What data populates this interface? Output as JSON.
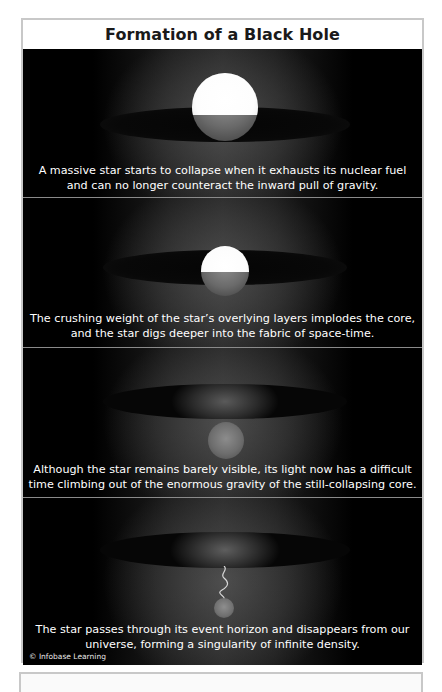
{
  "figure": {
    "title": "Formation of a Black Hole",
    "copyright": "© Infobase Learning",
    "panels": [
      {
        "stage": 1,
        "caption_line1": "A massive star starts to collapse when it exhausts its nuclear fuel",
        "caption_line2": "and can no longer counteract the inward pull of gravity.",
        "illustration": "large-bright-star-on-spacetime-sheet"
      },
      {
        "stage": 2,
        "caption_line1": "The crushing weight of the star’s overlying layers implodes the core,",
        "caption_line2": "and the star digs deeper into the fabric of space-time.",
        "illustration": "smaller-star-sinking-into-spacetime"
      },
      {
        "stage": 3,
        "caption_line1": "Although the star remains barely visible, its light now has a difficult",
        "caption_line2": "time climbing out of the enormous gravity of the still-collapsing core.",
        "illustration": "dim-star-below-spacetime-sheet"
      },
      {
        "stage": 4,
        "caption_line1": "The star passes through its event horizon and disappears from our",
        "caption_line2": "universe, forming a singularity of infinite density.",
        "illustration": "singularity-with-light-squiggle"
      }
    ]
  },
  "colors": {
    "background": "#000000",
    "frame_border": "#c8c8c8",
    "text": "#ffffff",
    "title_text": "#1a1a1a"
  }
}
